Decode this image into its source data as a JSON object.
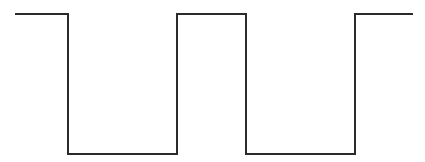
{
  "diagram": {
    "type": "square-wave",
    "stroke_color": "#2b2b2b",
    "stroke_width": 2,
    "background": "#ffffff",
    "points": [
      [
        15,
        14
      ],
      [
        68,
        14
      ],
      [
        68,
        154
      ],
      [
        177,
        154
      ],
      [
        177,
        14
      ],
      [
        246,
        14
      ],
      [
        246,
        154
      ],
      [
        355,
        154
      ],
      [
        355,
        14
      ],
      [
        413,
        14
      ]
    ]
  }
}
